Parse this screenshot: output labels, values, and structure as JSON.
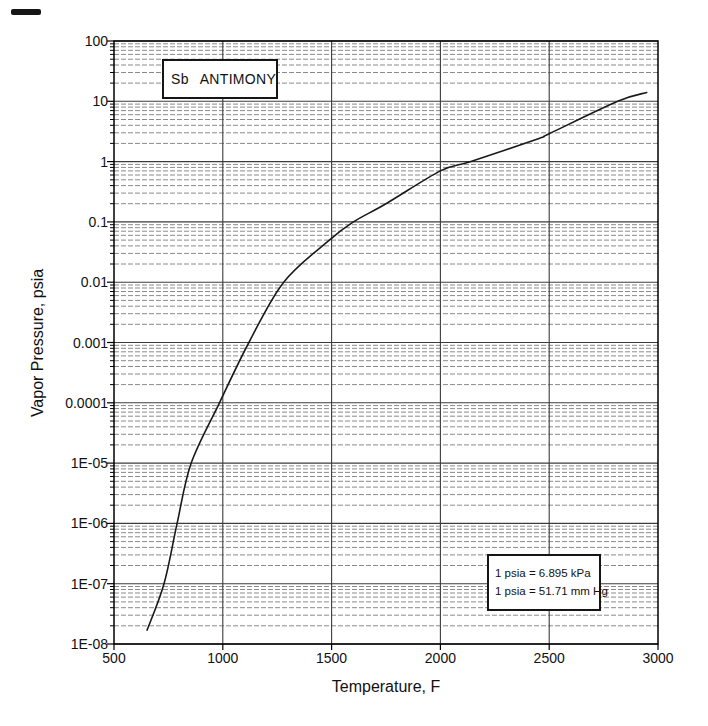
{
  "figure": {
    "title_box": {
      "symbol": "Sb",
      "name": "ANTIMONY"
    },
    "y_axis": {
      "label": "Vapor Pressure, psia",
      "ticks": [
        "100",
        "10",
        "1",
        "0.1",
        "0.01",
        "0.001",
        "0.0001",
        "1E-05",
        "1E-06",
        "1E-07",
        "1E-08"
      ]
    },
    "x_axis": {
      "label": "Temperature, F",
      "ticks": [
        "500",
        "1000",
        "1500",
        "2000",
        "2500",
        "3000"
      ]
    },
    "units_box": {
      "line1": "1 psia = 6.895 kPa",
      "line2": "1 psia = 51.71 mm Hg"
    }
  },
  "chart_data": {
    "type": "line",
    "title": "Sb ANTIMONY",
    "xlabel": "Temperature, F",
    "ylabel": "Vapor Pressure, psia",
    "xlim": [
      500,
      3000
    ],
    "ylim": [
      1e-08,
      100
    ],
    "y_scale": "log10",
    "x_major_ticks": [
      500,
      1000,
      1500,
      2000,
      2500,
      3000
    ],
    "x_gridlines": [
      1000,
      1500,
      2000,
      2500
    ],
    "y_decades": [
      1e-08,
      1e-07,
      1e-06,
      1e-05,
      0.0001,
      0.001,
      0.01,
      0.1,
      1,
      10,
      100
    ],
    "grid": "log: solid decade lines, dashed minor lines (2-9 per decade)",
    "legend": "none",
    "annotations": [
      "1 psia = 6.895 kPa",
      "1 psia = 51.71 mm Hg"
    ],
    "series": [
      {
        "name": "Sb vapor pressure curve",
        "points": [
          [
            652,
            1.7e-08
          ],
          [
            730,
            1e-07
          ],
          [
            790,
            1e-06
          ],
          [
            855,
            1e-05
          ],
          [
            985,
            0.0001
          ],
          [
            1120,
            0.001
          ],
          [
            1280,
            0.01
          ],
          [
            1490,
            0.05
          ],
          [
            1600,
            0.1
          ],
          [
            1750,
            0.2
          ],
          [
            2000,
            0.7
          ],
          [
            2140,
            1.0
          ],
          [
            2450,
            2.4
          ],
          [
            2500,
            2.9
          ],
          [
            2815,
            10
          ],
          [
            2948,
            14
          ]
        ]
      }
    ]
  },
  "colors": {
    "background": "#ffffff",
    "frame": "#000000",
    "grid_major": "#3c3c3c",
    "grid_minor": "#8a8a8a",
    "curve": "#1a1a1a",
    "text": "#111111"
  }
}
